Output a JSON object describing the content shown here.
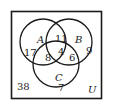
{
  "diagram": {
    "type": "venn-3-set",
    "universe_label": "U",
    "sets": [
      {
        "name": "A",
        "only": "17"
      },
      {
        "name": "B",
        "only": "9"
      },
      {
        "name": "C",
        "only": "7"
      }
    ],
    "regions": {
      "A_only": "17",
      "B_only": "9",
      "C_only": "7",
      "A_and_B_only": "11",
      "A_and_C_only": "8",
      "B_and_C_only": "6",
      "A_and_B_and_C": "4",
      "outside": "38"
    },
    "colors": {
      "stroke": "#1a1a1a",
      "background": "#ffffff"
    }
  }
}
